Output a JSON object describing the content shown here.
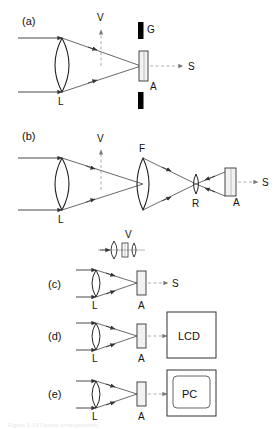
{
  "figure": {
    "panels": [
      {
        "id": "a",
        "label": "(a)",
        "components": [
          {
            "name": "lens",
            "label": "L"
          },
          {
            "name": "grating",
            "label": "G"
          },
          {
            "name": "aperture",
            "label": "A"
          },
          {
            "name": "viewing-direction",
            "label": "V"
          },
          {
            "name": "signal-output",
            "label": "S"
          }
        ]
      },
      {
        "id": "b",
        "label": "(b)",
        "components": [
          {
            "name": "lens",
            "label": "L"
          },
          {
            "name": "field-lens",
            "label": "F"
          },
          {
            "name": "relay-lens",
            "label": "R"
          },
          {
            "name": "aperture",
            "label": "A"
          },
          {
            "name": "viewing-direction",
            "label": "V"
          },
          {
            "name": "signal-output",
            "label": "S"
          }
        ]
      },
      {
        "id": "c",
        "label": "(c)",
        "components": [
          {
            "name": "lens",
            "label": "L"
          },
          {
            "name": "aperture",
            "label": "A"
          },
          {
            "name": "viewing-direction",
            "label": "V"
          },
          {
            "name": "signal-output",
            "label": "S"
          }
        ]
      },
      {
        "id": "d",
        "label": "(d)",
        "components": [
          {
            "name": "lens",
            "label": "L"
          },
          {
            "name": "aperture",
            "label": "A"
          },
          {
            "name": "display",
            "label": "LCD"
          }
        ]
      },
      {
        "id": "e",
        "label": "(e)",
        "components": [
          {
            "name": "lens",
            "label": "L"
          },
          {
            "name": "aperture",
            "label": "A"
          },
          {
            "name": "computer",
            "label": "PC"
          }
        ]
      }
    ],
    "labels": {
      "a": "(a)",
      "b": "(b)",
      "c": "(c)",
      "d": "(d)",
      "e": "(e)",
      "L": "L",
      "G": "G",
      "A": "A",
      "V": "V",
      "S": "S",
      "F": "F",
      "R": "R",
      "LCD": "LCD",
      "PC": "PC"
    },
    "caption": "Figure 1.13  Optical arrangements.",
    "colors": {
      "stroke": "#111111",
      "ray": "#444444",
      "dashed_ray": "#888888",
      "grating_fill": "#000000",
      "aperture_fill": "#f2f2f2",
      "background": "#ffffff"
    }
  }
}
